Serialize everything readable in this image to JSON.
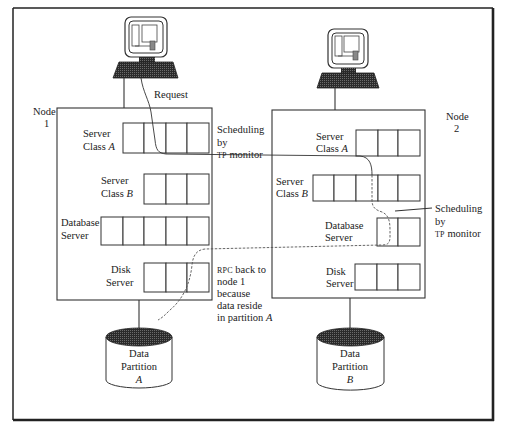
{
  "figure": {
    "request_label": "Request",
    "node1": {
      "label_line1": "Node",
      "label_line2": "1",
      "servers": [
        {
          "name_line1": "Server",
          "name_line2": "Class ",
          "name_italic": "A",
          "cells": 4
        },
        {
          "name_line1": "Server",
          "name_line2": "Class ",
          "name_italic": "B",
          "cells": 3
        },
        {
          "name_line1": "Database",
          "name_line2": "Server",
          "name_italic": "",
          "cells": 5
        },
        {
          "name_line1": "Disk",
          "name_line2": "Server",
          "name_italic": "",
          "cells": 3
        }
      ],
      "partition": {
        "line1": "Data",
        "line2": "Partition",
        "line3": "A"
      }
    },
    "node2": {
      "label_line1": "Node",
      "label_line2": "2",
      "servers": [
        {
          "name_line1": "Server",
          "name_line2": "Class ",
          "name_italic": "A",
          "cells": 3
        },
        {
          "name_line1": "Server",
          "name_line2": "Class ",
          "name_italic": "B",
          "cells": 5
        },
        {
          "name_line1": "Database",
          "name_line2": "Server",
          "name_italic": "",
          "cells": 2
        },
        {
          "name_line1": "Disk",
          "name_line2": "Server",
          "name_italic": "",
          "cells": 3
        }
      ],
      "partition": {
        "line1": "Data",
        "line2": "Partition",
        "line3": "B"
      }
    },
    "annotations": {
      "scheduling1": {
        "line1": "Scheduling",
        "line2": "by",
        "line3_sc": "TP",
        "line3_rest": " monitor"
      },
      "scheduling2": {
        "line1": "Scheduling",
        "line2": "by",
        "line3_sc": "TP",
        "line3_rest": " monitor"
      },
      "rpc": {
        "line1_sc": "RPC",
        "line1_rest": " back to",
        "line2": "node 1",
        "line3": "because",
        "line4": "data reside",
        "line5": "in partition ",
        "line5_italic": "A"
      }
    }
  }
}
